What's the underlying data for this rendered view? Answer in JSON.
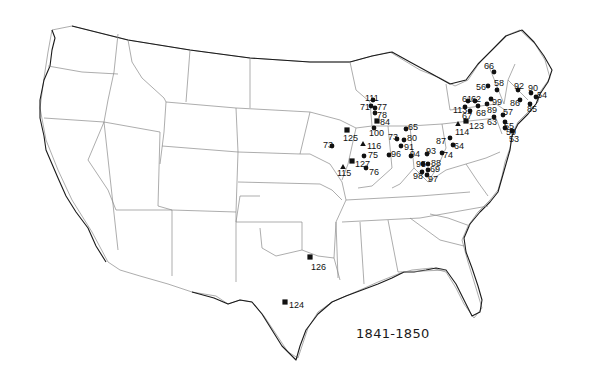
{
  "map": {
    "title": "1841-1850",
    "legend_symbols": {
      "circle": "circle-marker",
      "square": "square-marker",
      "triangle": "triangle-marker"
    },
    "colors": {
      "marker": "#111111",
      "coast": "#1a1a1a",
      "state_border": "#8a8a8a",
      "background": "#ffffff"
    },
    "sites": [
      {
        "label": "66",
        "shape": "circle",
        "x": 494,
        "y": 72,
        "lx": 484,
        "ly": 66
      },
      {
        "label": "56",
        "shape": "circle",
        "x": 488,
        "y": 86,
        "lx": 476,
        "ly": 87
      },
      {
        "label": "58",
        "shape": "circle",
        "x": 497,
        "y": 90,
        "lx": 494,
        "ly": 83
      },
      {
        "label": "92",
        "shape": "circle",
        "x": 518,
        "y": 90,
        "lx": 514,
        "ly": 86
      },
      {
        "label": "90",
        "shape": "circle",
        "x": 531,
        "y": 93,
        "lx": 528,
        "ly": 88
      },
      {
        "label": "54",
        "shape": "circle",
        "x": 536,
        "y": 97,
        "lx": 537,
        "ly": 95
      },
      {
        "label": "99",
        "shape": "circle",
        "x": 491,
        "y": 99,
        "lx": 492,
        "ly": 102
      },
      {
        "label": "89",
        "shape": "circle",
        "x": 487,
        "y": 104,
        "lx": 487,
        "ly": 110
      },
      {
        "label": "86",
        "shape": "circle",
        "x": 520,
        "y": 100,
        "lx": 510,
        "ly": 103
      },
      {
        "label": "85",
        "shape": "circle",
        "x": 530,
        "y": 104,
        "lx": 527,
        "ly": 109
      },
      {
        "label": "61",
        "shape": "circle",
        "x": 468,
        "y": 101,
        "lx": 462,
        "ly": 99
      },
      {
        "label": "62",
        "shape": "circle",
        "x": 475,
        "y": 101,
        "lx": 471,
        "ly": 99
      },
      {
        "label": "113",
        "shape": "circle",
        "x": 465,
        "y": 107,
        "lx": 453,
        "ly": 110
      },
      {
        "label": "68",
        "shape": "circle",
        "x": 478,
        "y": 106,
        "lx": 476,
        "ly": 113
      },
      {
        "label": "67",
        "shape": "circle",
        "x": 470,
        "y": 111,
        "lx": 462,
        "ly": 116
      },
      {
        "label": "57",
        "shape": "circle",
        "x": 503,
        "y": 115,
        "lx": 503,
        "ly": 112
      },
      {
        "label": "63",
        "shape": "circle",
        "x": 494,
        "y": 117,
        "lx": 487,
        "ly": 122
      },
      {
        "label": "55",
        "shape": "circle",
        "x": 505,
        "y": 122,
        "lx": 504,
        "ly": 126
      },
      {
        "label": "59",
        "shape": "circle",
        "x": 505,
        "y": 128,
        "lx": 506,
        "ly": 132
      },
      {
        "label": "53",
        "shape": "circle",
        "x": 512,
        "y": 131,
        "lx": 509,
        "ly": 139
      },
      {
        "label": "123",
        "shape": "square",
        "x": 466,
        "y": 121,
        "lx": 469,
        "ly": 126
      },
      {
        "label": "114",
        "shape": "triangle",
        "x": 458,
        "y": 124,
        "lx": 455,
        "ly": 132
      },
      {
        "label": "87",
        "shape": "circle",
        "x": 450,
        "y": 138,
        "lx": 436,
        "ly": 141
      },
      {
        "label": "64",
        "shape": "circle",
        "x": 453,
        "y": 145,
        "lx": 454,
        "ly": 146
      },
      {
        "label": "93",
        "shape": "circle",
        "x": 427,
        "y": 154,
        "lx": 426,
        "ly": 151
      },
      {
        "label": "74",
        "shape": "circle",
        "x": 442,
        "y": 153,
        "lx": 443,
        "ly": 155
      },
      {
        "label": "65",
        "shape": "circle",
        "x": 406,
        "y": 129,
        "lx": 408,
        "ly": 127
      },
      {
        "label": "73",
        "shape": "circle",
        "x": 397,
        "y": 139,
        "lx": 388,
        "ly": 137
      },
      {
        "label": "80",
        "shape": "circle",
        "x": 404,
        "y": 140,
        "lx": 407,
        "ly": 138
      },
      {
        "label": "91",
        "shape": "circle",
        "x": 401,
        "y": 146,
        "lx": 404,
        "ly": 147
      },
      {
        "label": "94",
        "shape": "circle",
        "x": 411,
        "y": 156,
        "lx": 410,
        "ly": 154
      },
      {
        "label": "96",
        "shape": "circle",
        "x": 389,
        "y": 155,
        "lx": 391,
        "ly": 154
      },
      {
        "label": "95",
        "shape": "circle",
        "x": 423,
        "y": 164,
        "lx": 416,
        "ly": 164
      },
      {
        "label": "88",
        "shape": "circle",
        "x": 428,
        "y": 164,
        "lx": 431,
        "ly": 163
      },
      {
        "label": "69",
        "shape": "circle",
        "x": 428,
        "y": 170,
        "lx": 430,
        "ly": 169
      },
      {
        "label": "98",
        "shape": "circle",
        "x": 422,
        "y": 172,
        "lx": 413,
        "ly": 176
      },
      {
        "label": "97",
        "shape": "circle",
        "x": 427,
        "y": 175,
        "lx": 428,
        "ly": 179
      },
      {
        "label": "111",
        "shape": "circle",
        "x": 373,
        "y": 100,
        "lx": 365,
        "ly": 98
      },
      {
        "label": "71",
        "shape": "circle",
        "x": 371,
        "y": 106,
        "lx": 360,
        "ly": 107
      },
      {
        "label": "77",
        "shape": "circle",
        "x": 375,
        "y": 108,
        "lx": 377,
        "ly": 107
      },
      {
        "label": "78",
        "shape": "circle",
        "x": 375,
        "y": 113,
        "lx": 377,
        "ly": 115
      },
      {
        "label": "84",
        "shape": "square",
        "x": 377,
        "y": 121,
        "lx": 380,
        "ly": 122
      },
      {
        "label": "100",
        "shape": "circle",
        "x": 374,
        "y": 128,
        "lx": 369,
        "ly": 133
      },
      {
        "label": "125",
        "shape": "square",
        "x": 347,
        "y": 130,
        "lx": 343,
        "ly": 138
      },
      {
        "label": "73",
        "shape": "circle",
        "x": 332,
        "y": 146,
        "lx": 323,
        "ly": 145
      },
      {
        "label": "116",
        "shape": "triangle",
        "x": 363,
        "y": 144,
        "lx": 367,
        "ly": 146
      },
      {
        "label": "75",
        "shape": "circle",
        "x": 364,
        "y": 156,
        "lx": 368,
        "ly": 155
      },
      {
        "label": "127",
        "shape": "square",
        "x": 352,
        "y": 161,
        "lx": 355,
        "ly": 164
      },
      {
        "label": "115",
        "shape": "triangle",
        "x": 343,
        "y": 167,
        "lx": 337,
        "ly": 173
      },
      {
        "label": "76",
        "shape": "circle",
        "x": 366,
        "y": 168,
        "lx": 369,
        "ly": 172
      },
      {
        "label": "126",
        "shape": "square",
        "x": 310,
        "y": 257,
        "lx": 311,
        "ly": 267
      },
      {
        "label": "124",
        "shape": "square",
        "x": 285,
        "y": 302,
        "lx": 289,
        "ly": 305
      }
    ]
  }
}
